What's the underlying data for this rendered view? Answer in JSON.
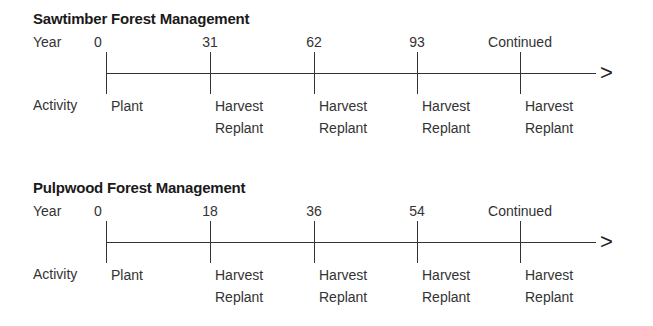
{
  "panels": [
    {
      "title": "Sawtimber Forest Management",
      "year_label": "Year",
      "activity_label": "Activity",
      "arrow": ">",
      "ticks": [
        {
          "year": "0",
          "x": 106,
          "activity": [
            "Plant",
            ""
          ]
        },
        {
          "year": "31",
          "x": 210,
          "activity": [
            "Harvest",
            "Replant"
          ]
        },
        {
          "year": "62",
          "x": 314,
          "activity": [
            "Harvest",
            "Replant"
          ]
        },
        {
          "year": "93",
          "x": 417,
          "activity": [
            "Harvest",
            "Replant"
          ]
        },
        {
          "year": "Continued",
          "x": 520,
          "activity": [
            "Harvest",
            "Replant"
          ]
        }
      ]
    },
    {
      "title": "Pulpwood Forest Management",
      "year_label": "Year",
      "activity_label": "Activity",
      "arrow": ">",
      "ticks": [
        {
          "year": "0",
          "x": 106,
          "activity": [
            "Plant",
            ""
          ]
        },
        {
          "year": "18",
          "x": 210,
          "activity": [
            "Harvest",
            "Replant"
          ]
        },
        {
          "year": "36",
          "x": 314,
          "activity": [
            "Harvest",
            "Replant"
          ]
        },
        {
          "year": "54",
          "x": 417,
          "activity": [
            "Harvest",
            "Replant"
          ]
        },
        {
          "year": "Continued",
          "x": 520,
          "activity": [
            "Harvest",
            "Replant"
          ]
        }
      ]
    }
  ]
}
